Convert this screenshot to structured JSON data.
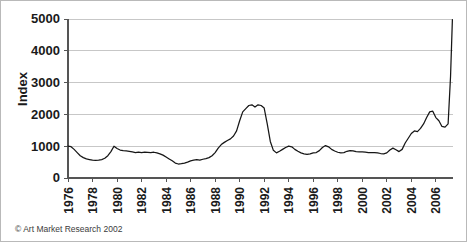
{
  "figure": {
    "credit": "© Art Market Research 2002"
  },
  "chart_data": {
    "type": "line",
    "title": "",
    "subtitle": "",
    "xlabel": "",
    "ylabel": "Index",
    "xlim": [
      1976,
      2007.4
    ],
    "ylim": [
      0,
      5000
    ],
    "grid": true,
    "legend": false,
    "legend_position": "none",
    "y_ticks": [
      0,
      1000,
      2000,
      3000,
      4000,
      5000
    ],
    "y_tick_labels": [
      "0",
      "1000",
      "2000",
      "3000",
      "4000",
      "5000"
    ],
    "x_ticks": [
      1976,
      1978,
      1980,
      1982,
      1984,
      1986,
      1988,
      1990,
      1992,
      1994,
      1996,
      1998,
      2000,
      2002,
      2004,
      2006
    ],
    "x_tick_labels": [
      "1976",
      "1978",
      "1980",
      "1982",
      "1984",
      "1986",
      "1988",
      "1990",
      "1992",
      "1994",
      "1996",
      "1998",
      "2000",
      "2002",
      "2004",
      "2006"
    ],
    "series": [
      {
        "name": "Art Market Index",
        "color": "#161616",
        "x": [
          1976.0,
          1976.25,
          1976.5,
          1976.75,
          1977.0,
          1977.25,
          1977.5,
          1977.75,
          1978.0,
          1978.25,
          1978.5,
          1978.75,
          1979.0,
          1979.25,
          1979.5,
          1979.75,
          1980.0,
          1980.25,
          1980.5,
          1980.75,
          1981.0,
          1981.25,
          1981.5,
          1981.75,
          1982.0,
          1982.25,
          1982.5,
          1982.75,
          1983.0,
          1983.25,
          1983.5,
          1983.75,
          1984.0,
          1984.25,
          1984.5,
          1984.75,
          1985.0,
          1985.25,
          1985.5,
          1985.75,
          1986.0,
          1986.25,
          1986.5,
          1986.75,
          1987.0,
          1987.25,
          1987.5,
          1987.75,
          1988.0,
          1988.25,
          1988.5,
          1988.75,
          1989.0,
          1989.25,
          1989.5,
          1989.75,
          1990.0,
          1990.25,
          1990.5,
          1990.75,
          1991.0,
          1991.25,
          1991.5,
          1991.75,
          1992.0,
          1992.25,
          1992.5,
          1992.75,
          1993.0,
          1993.25,
          1993.5,
          1993.75,
          1994.0,
          1994.25,
          1994.5,
          1994.75,
          1995.0,
          1995.25,
          1995.5,
          1995.75,
          1996.0,
          1996.25,
          1996.5,
          1996.75,
          1997.0,
          1997.25,
          1997.5,
          1997.75,
          1998.0,
          1998.25,
          1998.5,
          1998.75,
          1999.0,
          1999.25,
          1999.5,
          1999.75,
          2000.0,
          2000.25,
          2000.5,
          2000.75,
          2001.0,
          2001.25,
          2001.5,
          2001.75,
          2002.0,
          2002.25,
          2002.5,
          2002.75,
          2003.0,
          2003.25,
          2003.5,
          2003.75,
          2004.0,
          2004.25,
          2004.5,
          2004.75,
          2005.0,
          2005.25,
          2005.5,
          2005.75,
          2006.0,
          2006.25,
          2006.5,
          2006.75,
          2007.0,
          2007.2,
          2007.35
        ],
        "y": [
          1000,
          985,
          900,
          800,
          700,
          640,
          600,
          580,
          560,
          555,
          560,
          580,
          620,
          700,
          830,
          1000,
          930,
          880,
          860,
          850,
          840,
          820,
          800,
          810,
          800,
          810,
          805,
          800,
          810,
          790,
          760,
          720,
          660,
          600,
          540,
          470,
          440,
          450,
          470,
          500,
          540,
          560,
          575,
          560,
          590,
          610,
          640,
          700,
          800,
          940,
          1050,
          1120,
          1180,
          1230,
          1320,
          1480,
          1800,
          2080,
          2180,
          2280,
          2300,
          2230,
          2300,
          2280,
          2200,
          1700,
          1150,
          870,
          790,
          840,
          900,
          960,
          1000,
          980,
          900,
          840,
          790,
          760,
          740,
          760,
          790,
          800,
          860,
          960,
          1020,
          980,
          900,
          850,
          810,
          790,
          800,
          840,
          860,
          850,
          830,
          820,
          820,
          810,
          800,
          800,
          800,
          790,
          770,
          760,
          790,
          880,
          940,
          890,
          830,
          900,
          1100,
          1250,
          1400,
          1480,
          1460,
          1560,
          1700,
          1900,
          2080,
          2100,
          1900,
          1800,
          1620,
          1600,
          1700,
          3200,
          4980
        ]
      }
    ]
  }
}
